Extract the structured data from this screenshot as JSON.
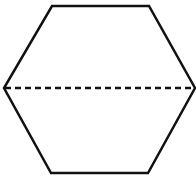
{
  "diagram": {
    "shape": "regular-hexagon",
    "stroke_color": "#111111",
    "background": "#ffffff",
    "vertices": [
      [
        52,
        6
      ],
      [
        149,
        6
      ],
      [
        195,
        88
      ],
      [
        148,
        173
      ],
      [
        51,
        173
      ],
      [
        4,
        88
      ]
    ],
    "divider": {
      "style": "dashed",
      "from": [
        4,
        88
      ],
      "to": [
        195,
        88
      ]
    }
  }
}
